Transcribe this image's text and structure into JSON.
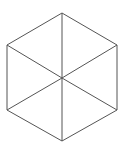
{
  "diagram": {
    "shape": "regular hexagon divided into six triangles",
    "stroke_color": "#555555",
    "background": "#ffffff",
    "vertices": {
      "top": [
        62,
        13
      ],
      "upper_right": [
        117,
        45
      ],
      "lower_right": [
        117,
        110
      ],
      "bottom": [
        62,
        141
      ],
      "lower_left": [
        7,
        110
      ],
      "upper_left": [
        7,
        45
      ],
      "center": [
        62,
        78
      ]
    }
  }
}
